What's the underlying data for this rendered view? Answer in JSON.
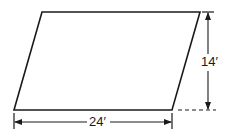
{
  "figure": {
    "shape": "parallelogram",
    "base_label": "24′",
    "height_label": "14′",
    "stroke_color": "#1a1a1a",
    "background_color": "#ffffff",
    "vertices": {
      "top_left": [
        42,
        12
      ],
      "top_right": [
        200,
        12
      ],
      "bottom_right": [
        172,
        110
      ],
      "bottom_left": [
        14,
        110
      ]
    },
    "base_dimension": {
      "y": 122,
      "x_start": 14,
      "x_end": 172
    },
    "height_dimension": {
      "x": 208,
      "y_start": 12,
      "y_end": 110
    }
  }
}
